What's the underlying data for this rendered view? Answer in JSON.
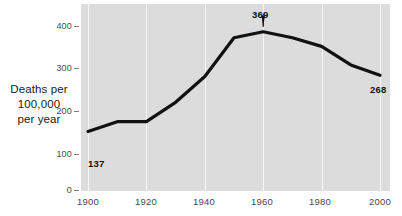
{
  "chart_data": {
    "type": "line",
    "title": "",
    "xlabel": "",
    "ylabel": "Deaths per 100,000 per year",
    "ylabel_lines": [
      "Deaths per",
      "100,000",
      "per year"
    ],
    "xlim": [
      1900,
      2000
    ],
    "ylim": [
      0,
      430
    ],
    "grid": "vertical only",
    "legend": "none",
    "x_ticks": [
      "1900",
      "1920",
      "1940",
      "1960",
      "1980",
      "2000"
    ],
    "x_tick_values": [
      1900,
      1920,
      1940,
      1960,
      1980,
      2000
    ],
    "y_ticks": [
      "0",
      "100",
      "200",
      "300",
      "400"
    ],
    "y_tick_values": [
      0,
      100,
      200,
      300,
      400
    ],
    "x": [
      1900,
      1910,
      1920,
      1930,
      1940,
      1950,
      1960,
      1970,
      1980,
      1990,
      2000
    ],
    "values": [
      137,
      160,
      160,
      205,
      265,
      355,
      369,
      355,
      335,
      292,
      268
    ],
    "annotations": [
      {
        "id": "start",
        "label": "137",
        "x": 1900,
        "y": 137,
        "arrow": false
      },
      {
        "id": "peak",
        "label": "369",
        "x": 1960,
        "y": 369,
        "arrow": true
      },
      {
        "id": "end",
        "label": "268",
        "x": 2000,
        "y": 268,
        "arrow": false
      }
    ],
    "line_color": "#111111",
    "plot_background": "#dcdcdc",
    "gridline_color": "#f7f7f7"
  },
  "axis": {
    "y_title_line1": "Deaths per",
    "y_title_line2": "100,000",
    "y_title_line3": "per year",
    "y_tick_0": "0",
    "y_tick_1": "100",
    "y_tick_2": "200",
    "y_tick_3": "300",
    "y_tick_4": "400",
    "x_tick_0": "1900",
    "x_tick_1": "1920",
    "x_tick_2": "1940",
    "x_tick_3": "1960",
    "x_tick_4": "1980",
    "x_tick_5": "2000"
  },
  "annotations": {
    "start_label": "137",
    "peak_label": "369",
    "end_label": "268"
  }
}
